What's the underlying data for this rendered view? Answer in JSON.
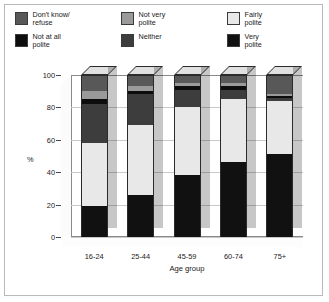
{
  "chart_data": {
    "type": "bar",
    "subtype": "stacked-column-3d",
    "title": "",
    "xlabel": "Age group",
    "ylabel": "%",
    "ylim": [
      0,
      100
    ],
    "yticks": [
      0,
      20,
      40,
      60,
      80,
      100
    ],
    "grid": true,
    "legend_position": "top",
    "categories": [
      "16-24",
      "25-44",
      "45-59",
      "60-74",
      "75+"
    ],
    "stack_order_bottom_to_top": [
      "Very polite",
      "Fairly polite",
      "Neither",
      "Not at all polite",
      "Not very polite",
      "Don't know/ refuse"
    ],
    "series": [
      {
        "name": "Very polite",
        "color": "#111111",
        "values": [
          19,
          26,
          38,
          46,
          51
        ]
      },
      {
        "name": "Fairly polite",
        "color": "#e8e8e8",
        "values": [
          39,
          43,
          42,
          39,
          33
        ]
      },
      {
        "name": "Neither",
        "color": "#3d3d3d",
        "values": [
          24,
          19,
          11,
          6,
          2
        ]
      },
      {
        "name": "Not at all polite",
        "color": "#0d0d0d",
        "values": [
          3,
          2,
          2,
          2,
          1
        ]
      },
      {
        "name": "Not very polite",
        "color": "#9a9a9a",
        "values": [
          5,
          3,
          2,
          2,
          1
        ]
      },
      {
        "name": "Don't know/ refuse",
        "color": "#585858",
        "values": [
          10,
          7,
          5,
          5,
          12
        ]
      }
    ]
  },
  "legend": {
    "rows": [
      [
        {
          "label": "Don't know/\nrefuse",
          "color": "#585858",
          "icon": "legend-swatch"
        },
        {
          "label": "Not very\npolite",
          "color": "#9a9a9a",
          "icon": "legend-swatch"
        },
        {
          "label": "Fairly\npolite",
          "color": "#e8e8e8",
          "icon": "legend-swatch"
        }
      ],
      [
        {
          "label": "Not at all\npolite",
          "color": "#0d0d0d",
          "icon": "legend-swatch"
        },
        {
          "label": "Neither",
          "color": "#3d3d3d",
          "icon": "legend-swatch"
        },
        {
          "label": "Very\npolite",
          "color": "#111111",
          "icon": "legend-swatch"
        }
      ]
    ]
  },
  "axes": {
    "ylabel": "%",
    "xlabel": "Age group",
    "yticks": [
      "100",
      "80",
      "60",
      "40",
      "20",
      "0"
    ],
    "xticks": [
      "16-24",
      "25-44",
      "45-59",
      "60-74",
      "75+"
    ]
  }
}
